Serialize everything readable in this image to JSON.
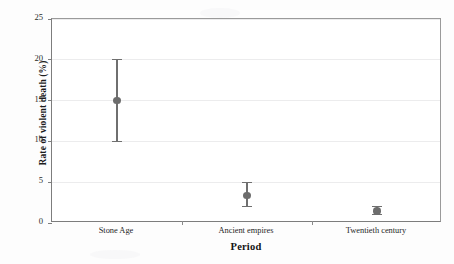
{
  "chart_data": {
    "type": "scatter",
    "title": "",
    "xlabel": "Period",
    "ylabel": "Rate of violent death (%)",
    "categories": [
      "Stone Age",
      "Ancient empires",
      "Twentieth century"
    ],
    "values": [
      15.0,
      3.4,
      1.5
    ],
    "error_low": [
      10.0,
      2.0,
      1.0
    ],
    "error_high": [
      20.0,
      5.0,
      2.0
    ],
    "series": [
      {
        "name": "Rate of violent death",
        "values": [
          15.0,
          3.4,
          1.5
        ],
        "error_low": [
          10.0,
          2.0,
          1.0
        ],
        "error_high": [
          20.0,
          5.0,
          2.0
        ]
      }
    ],
    "ylim": [
      0,
      25
    ],
    "yticks": [
      0,
      5,
      10,
      15,
      20,
      25
    ],
    "ytick_labels": [
      "0",
      "5",
      "10",
      "15",
      "20",
      "25"
    ],
    "grid": true,
    "legend": false,
    "marker_color": "#6d6d6d",
    "errorbar_color": "#6f6f6f",
    "axis_color": "#7d7d7d",
    "gridline_color": "#ececed",
    "background_color": "#ffffff"
  },
  "axes": {
    "y_title": "Rate of violent death (%)",
    "x_title": "Period",
    "y_tick_labels": [
      "25",
      "20",
      "15",
      "10",
      "5",
      "0"
    ],
    "x_tick_labels": [
      "Stone Age",
      "Ancient empires",
      "Twentieth century"
    ]
  }
}
